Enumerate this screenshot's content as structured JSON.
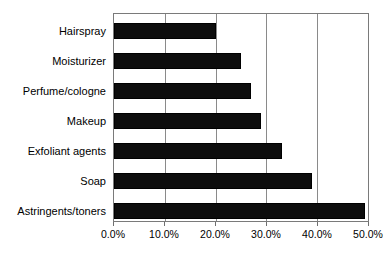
{
  "chart_data": {
    "type": "bar",
    "orientation": "horizontal",
    "title": "",
    "subtitle": "",
    "xlabel": "",
    "ylabel": "",
    "categories": [
      "Hairspray",
      "Moisturizer",
      "Perfume/cologne",
      "Makeup",
      "Exfoliant agents",
      "Soap",
      "Astringents/toners"
    ],
    "values": [
      20.0,
      25.0,
      27.0,
      29.0,
      33.0,
      39.0,
      49.5
    ],
    "value_format": "percent",
    "xlim": [
      0,
      50
    ],
    "xticks": [
      0,
      10,
      20,
      30,
      40,
      50
    ],
    "xtick_labels": [
      "0.0%",
      "10.0%",
      "20.0%",
      "30.0%",
      "40.0%",
      "50.0%"
    ],
    "grid": "vertical",
    "legend": "none",
    "bar_color": "#0d0d0d",
    "grid_color": "#8a8a8a",
    "axis_color": "#7a7a7a",
    "background_color": "#ffffff"
  }
}
